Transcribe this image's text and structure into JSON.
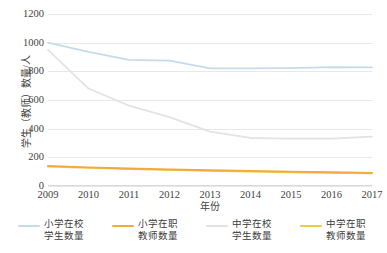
{
  "chart_data": {
    "type": "line",
    "title": "",
    "xlabel": "年份",
    "ylabel": "学生（教师）数量/人",
    "categories": [
      "2009",
      "2010",
      "2011",
      "2012",
      "2013",
      "2014",
      "2015",
      "2016",
      "2017"
    ],
    "x": [
      2009,
      2010,
      2011,
      2012,
      2013,
      2014,
      2015,
      2016,
      2017
    ],
    "ylim": [
      0,
      1200
    ],
    "yticks": [
      0,
      200,
      400,
      600,
      800,
      1000,
      1200
    ],
    "grid": true,
    "legend_position": "bottom",
    "series": [
      {
        "name": "小学在校学生数量",
        "color": "#c6dbe8",
        "values": [
          1000,
          935,
          880,
          875,
          820,
          820,
          822,
          830,
          828
        ]
      },
      {
        "name": "小学在职教师数量",
        "color": "#f3a93c",
        "values": [
          140,
          130,
          122,
          115,
          110,
          105,
          100,
          96,
          92
        ]
      },
      {
        "name": "中学在校学生数量",
        "color": "#e3e3e3",
        "values": [
          950,
          680,
          560,
          480,
          380,
          335,
          330,
          330,
          345
        ]
      },
      {
        "name": "中学在职教师数量",
        "color": "#f1c84b",
        "values": [
          135,
          126,
          118,
          112,
          106,
          100,
          96,
          92,
          88
        ]
      }
    ]
  },
  "axis": {
    "y_title": "学生（教师）数量/人",
    "x_title": "年份",
    "y_ticks": [
      "1200",
      "1000",
      "800",
      "600",
      "400",
      "200",
      "0"
    ],
    "x_ticks": [
      "2009",
      "2010",
      "2011",
      "2012",
      "2013",
      "2014",
      "2015",
      "2016",
      "2017"
    ]
  },
  "legend": {
    "items": [
      {
        "label": "小学在校\n学生数量",
        "color": "#c6dbe8"
      },
      {
        "label": "小学在职\n教师数量",
        "color": "#f3a93c"
      },
      {
        "label": "中学在校\n学生数量",
        "color": "#e3e3e3"
      },
      {
        "label": "中学在职\n教师数量",
        "color": "#f1c84b"
      }
    ]
  }
}
